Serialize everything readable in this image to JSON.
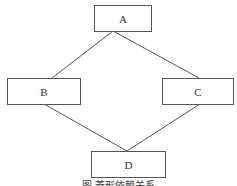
{
  "diagram": {
    "nodes": [
      {
        "id": "A",
        "label": "A"
      },
      {
        "id": "B",
        "label": "B"
      },
      {
        "id": "C",
        "label": "C"
      },
      {
        "id": "D",
        "label": "D"
      }
    ],
    "edges": [
      {
        "from": "A",
        "to": "B"
      },
      {
        "from": "A",
        "to": "C"
      },
      {
        "from": "B",
        "to": "D"
      },
      {
        "from": "C",
        "to": "D"
      }
    ],
    "caption": "图 菱形依赖关系",
    "colors": {
      "line": "#555555",
      "text": "#333333",
      "background": "#ffffff"
    }
  }
}
